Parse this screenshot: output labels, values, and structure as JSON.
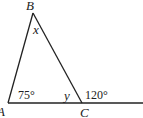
{
  "diagram": {
    "type": "triangle-exterior-angle",
    "vertices": [
      {
        "id": "A",
        "label": "A"
      },
      {
        "id": "B",
        "label": "B"
      },
      {
        "id": "C",
        "label": "C"
      }
    ],
    "angles": {
      "at_A": "75°",
      "at_B": "x",
      "at_C_interior": "y",
      "at_C_exterior": "120°"
    }
  }
}
